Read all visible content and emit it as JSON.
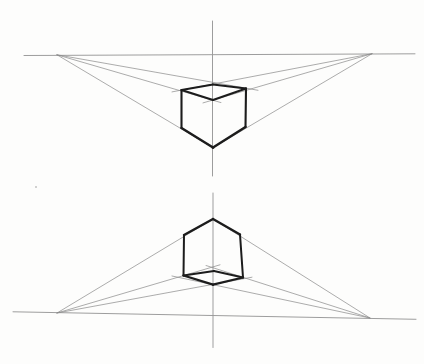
{
  "diagram": {
    "description_name": "two-point-perspective-cube-studies",
    "width": 424,
    "height": 364,
    "colors": {
      "background": "#fdfdfc",
      "construction_line": "#8c8c8c",
      "guide_line": "#989898",
      "cube_edge": "#1c1c1c",
      "speck": "#c2c2c2"
    },
    "speck": {
      "x": 36,
      "y": 187,
      "r": 1
    },
    "drawings": [
      {
        "name": "aerial-view-cube-drawing",
        "horizon": [
          24,
          55.5,
          415,
          53.8
        ],
        "vertical_axis": [
          212.5,
          21,
          212.5,
          176
        ],
        "vanishing_points": {
          "left": [
            57,
            54.8
          ],
          "right": [
            372,
            53.7
          ]
        },
        "construction_lines": [
          [
            57,
            54.8,
            258,
            90.3
          ],
          [
            57,
            54.8,
            221,
            102.6
          ],
          [
            57,
            54.8,
            214,
            148.3
          ],
          [
            372,
            53.7,
            172,
            91.9
          ],
          [
            372,
            53.7,
            203,
            102.9
          ],
          [
            372,
            53.7,
            212,
            148.3
          ]
        ],
        "cube_edges": [
          {
            "pts": [
              213,
              84.5,
              181.5,
              90
            ],
            "w": 1.8
          },
          {
            "pts": [
              213,
              84.5,
              246,
              88.5
            ],
            "w": 1.8
          },
          {
            "pts": [
              181.5,
              90,
              213,
              100
            ],
            "w": 2.0
          },
          {
            "pts": [
              246,
              88.5,
              213,
              100
            ],
            "w": 2.0
          },
          {
            "pts": [
              181.5,
              90,
              181.5,
              128
            ],
            "w": 2.1
          },
          {
            "pts": [
              246,
              88.5,
              245.5,
              127
            ],
            "w": 2.1
          },
          {
            "pts": [
              181.5,
              128,
              213,
              147.5
            ],
            "w": 2.5
          },
          {
            "pts": [
              245.5,
              127,
              213,
              147.5
            ],
            "w": 2.5
          }
        ]
      },
      {
        "name": "worms-eye-view-cube-drawing",
        "horizon": [
          13,
          311.8,
          416,
          319.3
        ],
        "vertical_axis": [
          213,
          193,
          213,
          347.5
        ],
        "vanishing_points": {
          "left": [
            57,
            313
          ],
          "right": [
            370,
            318
          ]
        },
        "construction_lines": [
          [
            57,
            313,
            252,
            277.2
          ],
          [
            57,
            313,
            220,
            264.8
          ],
          [
            57,
            313,
            213,
            219
          ],
          [
            370,
            318,
            172,
            276
          ],
          [
            370,
            318,
            206,
            265.5
          ],
          [
            370,
            318,
            213,
            219
          ]
        ],
        "cube_edges": [
          {
            "pts": [
              213,
              219,
              184,
              235
            ],
            "w": 2.4
          },
          {
            "pts": [
              213,
              219,
              240,
              234.5
            ],
            "w": 2.4
          },
          {
            "pts": [
              184,
              235,
              183.5,
              275.5
            ],
            "w": 2.0
          },
          {
            "pts": [
              240,
              234.5,
              243,
              277.5
            ],
            "w": 2.0
          },
          {
            "pts": [
              183.5,
              275.5,
              214,
              271
            ],
            "w": 1.8
          },
          {
            "pts": [
              214,
              271,
              243,
              277.5
            ],
            "w": 1.8
          },
          {
            "pts": [
              183.5,
              275.5,
              213,
              284.7
            ],
            "w": 2.3
          },
          {
            "pts": [
              213,
              284.7,
              243,
              277.5
            ],
            "w": 2.3
          }
        ]
      }
    ]
  }
}
